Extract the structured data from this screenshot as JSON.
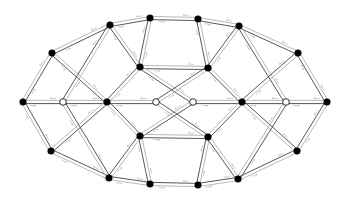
{
  "diagram": {
    "type": "graph",
    "colors": {
      "edge_dark": "#444444",
      "edge_light": "#b0b0b0",
      "node_filled": "#000000",
      "node_hollow_fill": "#ffffff",
      "node_stroke": "#000000",
      "label": "#9a9a9a"
    },
    "nodes": [
      {
        "id": "n0",
        "x": 23,
        "y": 102,
        "kind": "filled"
      },
      {
        "id": "n1",
        "x": 52,
        "y": 53,
        "kind": "filled"
      },
      {
        "id": "n2",
        "x": 110,
        "y": 25,
        "kind": "filled"
      },
      {
        "id": "n3",
        "x": 150,
        "y": 18,
        "kind": "filled"
      },
      {
        "id": "n4",
        "x": 198,
        "y": 19,
        "kind": "filled"
      },
      {
        "id": "n5",
        "x": 239,
        "y": 26,
        "kind": "filled"
      },
      {
        "id": "n6",
        "x": 298,
        "y": 53,
        "kind": "filled"
      },
      {
        "id": "n7",
        "x": 327,
        "y": 102,
        "kind": "filled"
      },
      {
        "id": "n8",
        "x": 297,
        "y": 151,
        "kind": "filled"
      },
      {
        "id": "n9",
        "x": 238,
        "y": 179,
        "kind": "filled"
      },
      {
        "id": "n10",
        "x": 198,
        "y": 185,
        "kind": "filled"
      },
      {
        "id": "n11",
        "x": 150,
        "y": 184,
        "kind": "filled"
      },
      {
        "id": "n12",
        "x": 109,
        "y": 178,
        "kind": "filled"
      },
      {
        "id": "n13",
        "x": 51,
        "y": 151,
        "kind": "filled"
      },
      {
        "id": "n14",
        "x": 63,
        "y": 102,
        "kind": "hollow"
      },
      {
        "id": "n15",
        "x": 107,
        "y": 102,
        "kind": "filled"
      },
      {
        "id": "n16",
        "x": 156,
        "y": 102,
        "kind": "hollow"
      },
      {
        "id": "n17",
        "x": 193,
        "y": 102,
        "kind": "hollow"
      },
      {
        "id": "n18",
        "x": 242,
        "y": 102,
        "kind": "filled"
      },
      {
        "id": "n19",
        "x": 286,
        "y": 102,
        "kind": "hollow"
      },
      {
        "id": "n20",
        "x": 140,
        "y": 67,
        "kind": "filled"
      },
      {
        "id": "n21",
        "x": 208,
        "y": 68,
        "kind": "filled"
      },
      {
        "id": "n22",
        "x": 140,
        "y": 136,
        "kind": "filled"
      },
      {
        "id": "n23",
        "x": 208,
        "y": 137,
        "kind": "filled"
      }
    ],
    "edges": [
      [
        "n0",
        "n1"
      ],
      [
        "n1",
        "n2"
      ],
      [
        "n2",
        "n3"
      ],
      [
        "n3",
        "n4"
      ],
      [
        "n4",
        "n5"
      ],
      [
        "n5",
        "n6"
      ],
      [
        "n6",
        "n7"
      ],
      [
        "n7",
        "n8"
      ],
      [
        "n8",
        "n9"
      ],
      [
        "n9",
        "n10"
      ],
      [
        "n10",
        "n11"
      ],
      [
        "n11",
        "n12"
      ],
      [
        "n12",
        "n13"
      ],
      [
        "n13",
        "n0"
      ],
      [
        "n0",
        "n14"
      ],
      [
        "n14",
        "n15"
      ],
      [
        "n15",
        "n16"
      ],
      [
        "n17",
        "n18"
      ],
      [
        "n18",
        "n19"
      ],
      [
        "n19",
        "n7"
      ],
      [
        "n1",
        "n15"
      ],
      [
        "n2",
        "n14"
      ],
      [
        "n13",
        "n15"
      ],
      [
        "n12",
        "n14"
      ],
      [
        "n2",
        "n20"
      ],
      [
        "n3",
        "n20"
      ],
      [
        "n20",
        "n15"
      ],
      [
        "n20",
        "n21"
      ],
      [
        "n20",
        "n17"
      ],
      [
        "n4",
        "n21"
      ],
      [
        "n5",
        "n21"
      ],
      [
        "n21",
        "n16"
      ],
      [
        "n21",
        "n18"
      ],
      [
        "n22",
        "n15"
      ],
      [
        "n22",
        "n17"
      ],
      [
        "n22",
        "n23"
      ],
      [
        "n22",
        "n11"
      ],
      [
        "n22",
        "n12"
      ],
      [
        "n23",
        "n16"
      ],
      [
        "n23",
        "n18"
      ],
      [
        "n23",
        "n10"
      ],
      [
        "n23",
        "n9"
      ],
      [
        "n5",
        "n19"
      ],
      [
        "n6",
        "n18"
      ],
      [
        "n8",
        "n18"
      ],
      [
        "n9",
        "n19"
      ]
    ]
  }
}
